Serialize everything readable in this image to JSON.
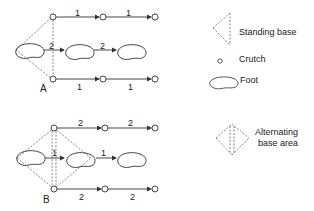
{
  "diagram": {
    "panel_a": {
      "label": "A",
      "top_row_steps": [
        "1",
        "1"
      ],
      "middle_row_steps": [
        "2",
        "2"
      ],
      "bottom_row_steps": [
        "1",
        "1"
      ]
    },
    "panel_b": {
      "label": "B",
      "top_row_steps": [
        "2",
        "2"
      ],
      "middle_row_steps": [
        "1",
        "1"
      ],
      "bottom_row_steps": [
        "2",
        "2"
      ]
    },
    "legend": {
      "standing_base": "Standing base",
      "crutch": "Crutch",
      "foot": "Foot",
      "alternating_base_line1": "Alternating",
      "alternating_base_line2": "base area"
    },
    "colors": {
      "stroke": "#333333",
      "background": "#ffffff"
    }
  }
}
